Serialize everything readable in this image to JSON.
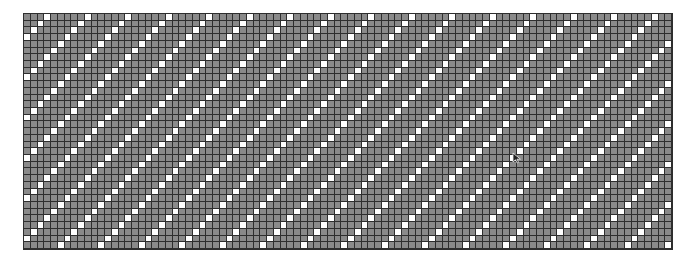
{
  "board": {
    "label": "Pixel grid board",
    "rows": 35,
    "cols": 96,
    "pattern": {
      "type": "diagonal-stripes",
      "rule": "white when (row + col) % period == offset",
      "period": 6,
      "offset": 3
    },
    "colors": {
      "cell_filled": "#8a8a8a",
      "cell_white": "#ffffff",
      "grid_line": "#2e2e2e",
      "background": "#ffffff"
    }
  },
  "cursor": {
    "icon": "mouse-pointer-icon",
    "x": 512,
    "y": 149
  }
}
